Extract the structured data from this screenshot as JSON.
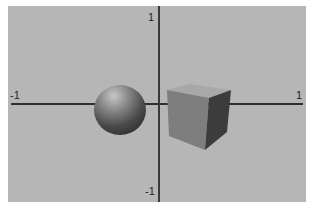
{
  "scene": {
    "background_color": "#b6b6b6",
    "axes": {
      "x_min_label": "-1",
      "x_max_label": "1",
      "y_max_label": "1",
      "y_min_label": "-1",
      "color": "#2f2f2f"
    },
    "objects": [
      {
        "type": "sphere",
        "name": "sphere",
        "position": "left of origin"
      },
      {
        "type": "cube",
        "name": "cube",
        "position": "right of origin"
      }
    ]
  }
}
